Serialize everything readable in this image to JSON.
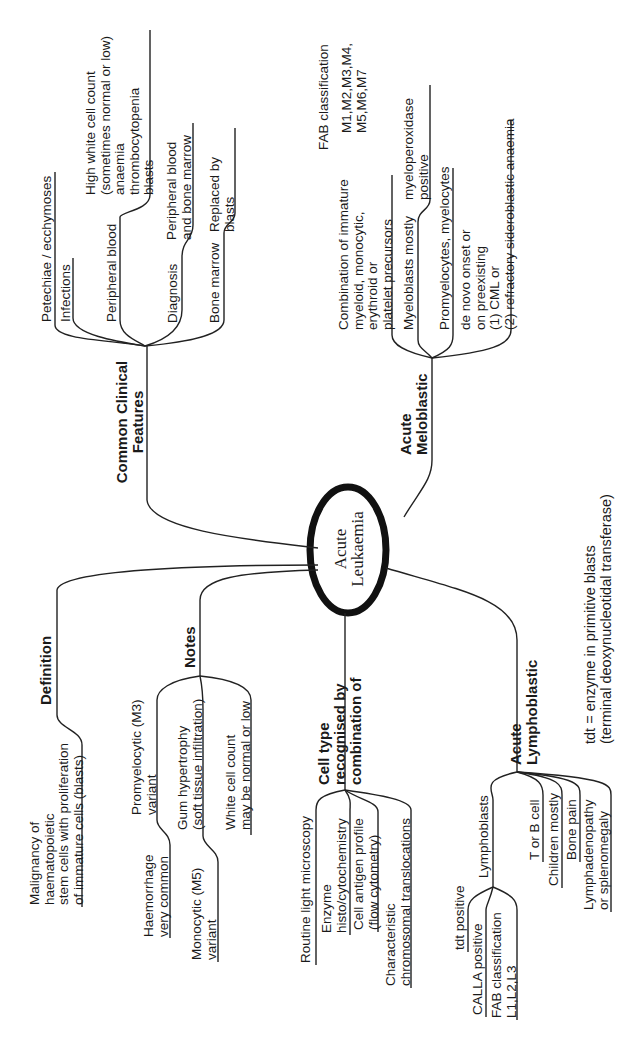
{
  "title": "Acute Leukaemia",
  "center": {
    "label": "Acute\nLeukaemia"
  },
  "branches": {
    "common_clinical_features": {
      "label": "Common Clinical\nFeatures",
      "children": [
        {
          "label": "Petechiae / ecchymoses"
        },
        {
          "label": "Infections"
        },
        {
          "label": "Peripheral blood",
          "detail": "High white cell count\n(sometimes normal or low)\nanaemia\nthrombocytopenia\nblasts"
        },
        {
          "label": "Diagnosis",
          "detail": "Peripheral blood\nand bone marrow"
        },
        {
          "label": "Bone marrow",
          "detail": "Replaced by\nblasts"
        }
      ]
    },
    "acute_meloblastic": {
      "label": "Acute\nMeloblastic",
      "fab": {
        "label": "FAB classification",
        "value": "M1,M2,M3,M4,\nM5,M6,M7"
      },
      "children": [
        {
          "label": "Combination of immature\nmyeloid, monocytic,\nerythroid or\nplatelet precursors"
        },
        {
          "label": "Myeloblasts mostly",
          "detail": "myeloperoxidase\npositive"
        },
        {
          "label": "Promyelocytes, myelocytes"
        },
        {
          "label": "de novo onset or\non preexisting\n(1) CML or\n(2) refractory sideroblastic anaemia"
        }
      ]
    },
    "definition": {
      "label": "Definition",
      "detail": "Malignancy of\nhaematopoietic\nstem cells with proliferation\nof immature cells (blasts)"
    },
    "notes": {
      "label": "Notes",
      "children": [
        {
          "label": "Promyelocytic (M3)\nvariant",
          "detail": "Haemorrhage\nvery common"
        },
        {
          "label": "Gum hypertrophy\n(soft tissue infiltration)",
          "detail": "Monocytic (M5)\nvariant"
        },
        {
          "label": "White cell count\nmay be normal or low"
        }
      ]
    },
    "cell_type": {
      "label": "Cell type\nrecognised by\ncombination of",
      "children": [
        {
          "label": "Routine light microscopy"
        },
        {
          "label": "Enzyme\nhisto/cytochemistry"
        },
        {
          "label": "Cell antigen profile\n(flow cytometry)"
        },
        {
          "label": "Characteristic\nchromosomal translocations"
        }
      ]
    },
    "acute_lymphoblastic": {
      "label": "Acute\nLymphoblastic",
      "lymphoblasts": {
        "label": "Lymphoblasts",
        "children": [
          {
            "label": "tdt positive"
          },
          {
            "label": "CALLA positive"
          },
          {
            "label": "FAB classification\nL1,L2,L3"
          }
        ]
      },
      "children": [
        {
          "label": "T or B cell"
        },
        {
          "label": "Children mostly"
        },
        {
          "label": "Bone pain"
        },
        {
          "label": "Lymphadenopathy\nor splenomegaly"
        }
      ]
    }
  },
  "footnote": "tdt = enzyme in primitive blasts\n(terminal deoxynucleotidal transferase)"
}
